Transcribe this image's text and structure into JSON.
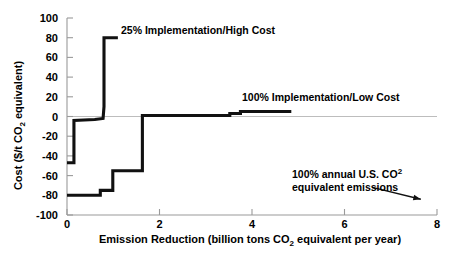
{
  "chart_data": {
    "type": "line",
    "title": "",
    "xlabel": "Emission Reduction (billion tons CO2 equivalent per year)",
    "ylabel": "Cost ($/t CO2 equivalent)",
    "xlim": [
      0,
      8
    ],
    "ylim": [
      -100,
      100
    ],
    "xticks": [
      0,
      2,
      4,
      6,
      8
    ],
    "yticks": [
      100,
      80,
      60,
      40,
      20,
      0,
      -20,
      -40,
      -60,
      -80,
      -100
    ],
    "grid": false,
    "legend_position": "inline-annotations",
    "series": [
      {
        "name": "25% Implementation/High Cost",
        "step": "post",
        "x": [
          0.0,
          0.15,
          0.15,
          0.6,
          0.78,
          0.8,
          0.8,
          1.1
        ],
        "y": [
          -47,
          -47,
          -4,
          -3,
          -2,
          10,
          80,
          80
        ]
      },
      {
        "name": "100% Implementation/Low Cost",
        "step": "post",
        "x": [
          0.0,
          0.72,
          0.72,
          0.99,
          0.99,
          1.63,
          1.63,
          3.52,
          3.52,
          3.75,
          3.75,
          4.85
        ],
        "y": [
          -80,
          -80,
          -75,
          -75,
          -55,
          -55,
          1,
          1,
          3,
          3,
          5,
          5
        ]
      }
    ],
    "annotations": [
      {
        "name": "high-cost-label",
        "text": "25% Implementation/High Cost",
        "x": 1.2,
        "y": 82
      },
      {
        "name": "low-cost-label",
        "text": "100% Implementation/Low Cost",
        "x": 3.6,
        "y": 18
      },
      {
        "name": "us-emissions-label",
        "line1_a": "100% annual U.S. CO",
        "line1_sup": "2",
        "line2": "equivalent emissions",
        "x": 5.6,
        "y": -55,
        "arrow_from": [
          6.6,
          -72
        ],
        "arrow_to": [
          7.65,
          -84
        ]
      }
    ]
  },
  "axes": {
    "y_tick_labels": [
      "100",
      "80",
      "60",
      "40",
      "20",
      "0",
      "-20",
      "-40",
      "-60",
      "-80",
      "-100"
    ],
    "x_tick_labels": [
      "0",
      "2",
      "4",
      "6",
      "8"
    ],
    "ylabel_pre": "Cost ($/t CO",
    "ylabel_sub": "2",
    "ylabel_post": " equivalent)",
    "xlabel_pre": "Emission Reduction (billion tons CO",
    "xlabel_sub": "2",
    "xlabel_post": " equivalent per year)"
  },
  "colors": {
    "background": "#ffffff",
    "ink": "#000000",
    "axis": "#808080",
    "curve": "#111111"
  }
}
